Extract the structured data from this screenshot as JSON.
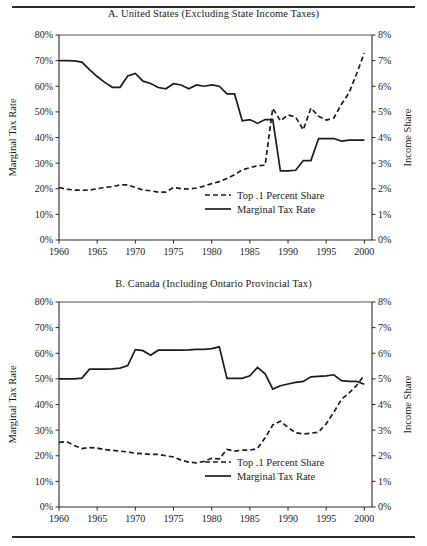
{
  "figure": {
    "top_rule": "horizontal-rule",
    "bottom_rule": "horizontal-rule"
  },
  "panels": [
    {
      "id": "panel-a",
      "title": "A. United States (Excluding State Income Taxes)"
    },
    {
      "id": "panel-b",
      "title": "B. Canada (Including Ontario Provincial Tax)"
    }
  ],
  "chart_data": [
    {
      "type": "line",
      "title": "A. United States (Excluding State Income Taxes)",
      "xlabel": "",
      "ylabel": "Marginal Tax Rate",
      "y2label": "Income Share",
      "xlim": [
        1960,
        2001
      ],
      "ylim": [
        0,
        80
      ],
      "y2lim": [
        0,
        8
      ],
      "grid": false,
      "legend_position": "bottom-right",
      "xticks": [
        1960,
        1965,
        1970,
        1975,
        1980,
        1985,
        1990,
        1995,
        2000
      ],
      "xticklabels": [
        "1960",
        "1965",
        "1970",
        "1975",
        "1980",
        "1985",
        "1990",
        "1995",
        "2000"
      ],
      "yticks": [
        0,
        10,
        20,
        30,
        40,
        50,
        60,
        70,
        80
      ],
      "yticklabels": [
        "0%",
        "10%",
        "20%",
        "30%",
        "40%",
        "50%",
        "60%",
        "70%",
        "80%"
      ],
      "y2ticks": [
        0,
        1,
        2,
        3,
        4,
        5,
        6,
        7,
        8
      ],
      "y2ticklabels": [
        "0%",
        "1%",
        "2%",
        "3%",
        "4%",
        "5%",
        "6%",
        "7%",
        "8%"
      ],
      "x": [
        1960,
        1961,
        1962,
        1963,
        1964,
        1965,
        1966,
        1967,
        1968,
        1969,
        1970,
        1971,
        1972,
        1973,
        1974,
        1975,
        1976,
        1977,
        1978,
        1979,
        1980,
        1981,
        1982,
        1983,
        1984,
        1985,
        1986,
        1987,
        1988,
        1989,
        1990,
        1991,
        1992,
        1993,
        1994,
        1995,
        1996,
        1997,
        1998,
        1999,
        2000
      ],
      "series": [
        {
          "name": "Marginal Tax Rate",
          "style": "solid",
          "axis": "left",
          "units": "%",
          "values": [
            70.0,
            70.0,
            69.9,
            69.4,
            66.5,
            63.8,
            61.5,
            59.6,
            59.6,
            64.0,
            65.0,
            62.0,
            61.1,
            59.5,
            59.0,
            61.0,
            60.5,
            59.0,
            60.5,
            60.0,
            60.5,
            60.0,
            57.0,
            57.0,
            46.5,
            47.0,
            45.5,
            47.0,
            47.0,
            27.0,
            27.0,
            27.2,
            31.0,
            31.0,
            39.6,
            39.6,
            39.6,
            38.6,
            39.0,
            39.0,
            39.0
          ]
        },
        {
          "name": "Top .1 Percent Share",
          "style": "dashed",
          "axis": "right",
          "units": "%",
          "values": [
            2.05,
            1.98,
            1.95,
            1.94,
            1.95,
            2.0,
            2.06,
            2.08,
            2.15,
            2.15,
            2.05,
            1.95,
            1.92,
            1.87,
            1.87,
            2.05,
            2.0,
            1.99,
            2.03,
            2.1,
            2.2,
            2.28,
            2.4,
            2.55,
            2.74,
            2.82,
            2.9,
            2.92,
            5.14,
            4.65,
            4.88,
            4.8,
            4.3,
            5.15,
            4.83,
            4.68,
            4.76,
            5.3,
            5.75,
            6.5,
            7.3
          ]
        }
      ]
    },
    {
      "type": "line",
      "title": "B. Canada (Including Ontario Provincial Tax)",
      "xlabel": "",
      "ylabel": "Marginal Tax Rate",
      "y2label": "Income Share",
      "xlim": [
        1960,
        2001
      ],
      "ylim": [
        0,
        80
      ],
      "y2lim": [
        0,
        8
      ],
      "grid": false,
      "legend_position": "bottom-right",
      "xticks": [
        1960,
        1965,
        1970,
        1975,
        1980,
        1985,
        1990,
        1995,
        2000
      ],
      "xticklabels": [
        "1960",
        "1965",
        "1970",
        "1975",
        "1980",
        "1985",
        "1990",
        "1995",
        "2000"
      ],
      "yticks": [
        0,
        10,
        20,
        30,
        40,
        50,
        60,
        70,
        80
      ],
      "yticklabels": [
        "0%",
        "10%",
        "20%",
        "30%",
        "40%",
        "50%",
        "60%",
        "70%",
        "80%"
      ],
      "y2ticks": [
        0,
        1,
        2,
        3,
        4,
        5,
        6,
        7,
        8
      ],
      "y2ticklabels": [
        "0%",
        "1%",
        "2%",
        "3%",
        "4%",
        "5%",
        "6%",
        "7%",
        "8%"
      ],
      "x": [
        1960,
        1961,
        1962,
        1963,
        1964,
        1965,
        1966,
        1967,
        1968,
        1969,
        1970,
        1971,
        1972,
        1973,
        1974,
        1975,
        1976,
        1977,
        1978,
        1979,
        1980,
        1981,
        1982,
        1983,
        1984,
        1985,
        1986,
        1987,
        1988,
        1989,
        1990,
        1991,
        1992,
        1993,
        1994,
        1995,
        1996,
        1997,
        1998,
        1999,
        2000
      ],
      "series": [
        {
          "name": "Marginal Tax Rate",
          "style": "solid",
          "axis": "left",
          "units": "%",
          "values": [
            50.0,
            50.0,
            50.0,
            50.3,
            53.8,
            53.8,
            53.8,
            53.9,
            54.2,
            55.2,
            61.4,
            61.0,
            59.2,
            61.2,
            61.2,
            61.2,
            61.2,
            61.3,
            61.5,
            61.5,
            61.8,
            62.5,
            50.2,
            50.2,
            50.2,
            51.2,
            54.5,
            52.0,
            46.0,
            47.3,
            48.0,
            48.6,
            49.0,
            50.8,
            51.0,
            51.2,
            51.6,
            49.3,
            49.0,
            49.0,
            47.9
          ]
        },
        {
          "name": "Top .1 Percent Share",
          "style": "dashed",
          "axis": "right",
          "units": "%",
          "values": [
            2.52,
            2.55,
            2.4,
            2.28,
            2.32,
            2.3,
            2.24,
            2.21,
            2.18,
            2.15,
            2.1,
            2.08,
            2.05,
            2.05,
            2.0,
            1.95,
            1.83,
            1.75,
            1.72,
            1.78,
            1.9,
            1.88,
            2.25,
            2.18,
            2.22,
            2.22,
            2.28,
            2.7,
            3.2,
            3.35,
            3.1,
            2.9,
            2.85,
            2.88,
            2.92,
            3.25,
            3.7,
            4.2,
            4.45,
            4.75,
            5.15
          ]
        }
      ]
    }
  ],
  "legend": {
    "entries": [
      {
        "label": "Top .1 Percent Share",
        "style": "dashed"
      },
      {
        "label": "Marginal Tax Rate",
        "style": "solid"
      }
    ]
  }
}
